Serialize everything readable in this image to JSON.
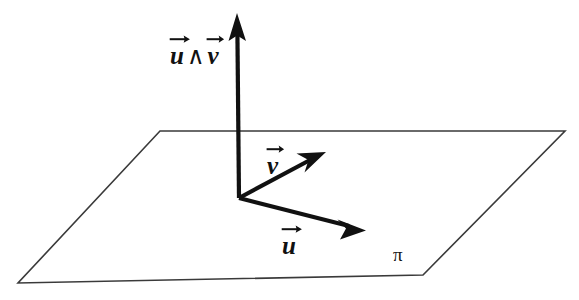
{
  "figure": {
    "background_color": "#ffffff",
    "plane": {
      "name": "pi",
      "label": "π",
      "stroke_color": "#3a3a3a",
      "stroke_width": 1.5,
      "fill": "none",
      "vertices": [
        {
          "x": 160,
          "y": 131
        },
        {
          "x": 565,
          "y": 131
        },
        {
          "x": 423,
          "y": 275
        },
        {
          "x": 18,
          "y": 283
        }
      ],
      "label_position": {
        "x": 398,
        "y": 258
      }
    },
    "origin": {
      "x": 239,
      "y": 198
    },
    "vectors": [
      {
        "id": "cross",
        "letter": "",
        "label_text": "u ∧ v",
        "label_parts": {
          "first": "u",
          "operator": "∧",
          "second": "v"
        },
        "from": {
          "x": 239,
          "y": 198
        },
        "to": {
          "x": 237,
          "y": 14
        },
        "color": "#111111",
        "stroke_width": 4,
        "label_position": {
          "x": 170,
          "y": 34
        }
      },
      {
        "id": "v",
        "letter": "v",
        "label_text": "v",
        "from": {
          "x": 239,
          "y": 198
        },
        "to": {
          "x": 325,
          "y": 152
        },
        "color": "#111111",
        "stroke_width": 4,
        "label_position": {
          "x": 267,
          "y": 144
        }
      },
      {
        "id": "u",
        "letter": "u",
        "label_text": "u",
        "from": {
          "x": 239,
          "y": 198
        },
        "to": {
          "x": 365,
          "y": 230
        },
        "color": "#111111",
        "stroke_width": 4,
        "label_position": {
          "x": 282,
          "y": 224
        }
      }
    ]
  }
}
